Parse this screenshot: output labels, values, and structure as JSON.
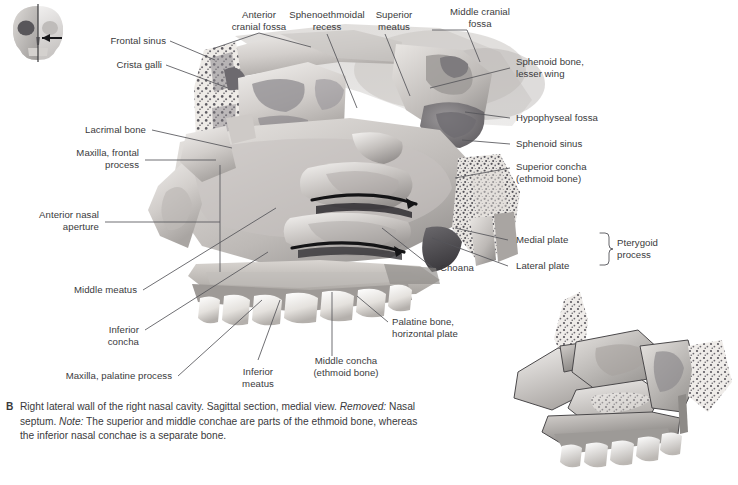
{
  "figure": {
    "plate_tag": "B",
    "caption_parts": {
      "p1": "Right lateral wall of the right nasal cavity. Sagittal section, medial view. ",
      "em1": "Removed:",
      "p2": " Nasal septum. ",
      "em2": "Note:",
      "p3": " The superior and middle conchae are parts of the ethmoid bone, whereas the inferior nasal conchae is a separate bone."
    },
    "orientation_icon": {
      "name": "skull-orientation-icon",
      "description": "Anterior skull with sagittal section line and view-direction arrow"
    },
    "colors": {
      "text": "#3a3a3c",
      "leader": "#55555a",
      "background": "#ffffff",
      "bone_light": "#e9e6e2",
      "bone_mid": "#b9b5b1",
      "bone_dark": "#6f6c6a",
      "cavity_shadow": "#58565a"
    }
  },
  "labels": [
    {
      "id": "frontal-sinus",
      "text": "Frontal sinus",
      "align": "right"
    },
    {
      "id": "crista-galli",
      "text": "Crista galli",
      "align": "right"
    },
    {
      "id": "anterior-cranial-fossa",
      "text": "Anterior\ncranial fossa",
      "align": "center"
    },
    {
      "id": "sphenoethmoidal-recess",
      "text": "Sphenoethmoidal\nrecess",
      "align": "center"
    },
    {
      "id": "superior-meatus",
      "text": "Superior\nmeatus",
      "align": "center"
    },
    {
      "id": "middle-cranial-fossa",
      "text": "Middle cranial\nfossa",
      "align": "center"
    },
    {
      "id": "sphenoid-bone-lesser-wing",
      "text": "Sphenoid bone,\nlesser wing",
      "align": "left"
    },
    {
      "id": "hypophyseal-fossa",
      "text": "Hypophyseal fossa",
      "align": "left"
    },
    {
      "id": "sphenoid-sinus",
      "text": "Sphenoid sinus",
      "align": "left"
    },
    {
      "id": "superior-concha",
      "text": "Superior concha\n(ethmoid bone)",
      "align": "left"
    },
    {
      "id": "medial-plate",
      "text": "Medial plate",
      "align": "left"
    },
    {
      "id": "lateral-plate",
      "text": "Lateral plate",
      "align": "left"
    },
    {
      "id": "pterygoid-process",
      "text": "Pterygoid\nprocess",
      "align": "left"
    },
    {
      "id": "choana",
      "text": "Choana",
      "align": "left"
    },
    {
      "id": "lacrimal-bone",
      "text": "Lacrimal bone",
      "align": "right"
    },
    {
      "id": "maxilla-frontal-process",
      "text": "Maxilla, frontal\nprocess",
      "align": "right"
    },
    {
      "id": "anterior-nasal-aperture",
      "text": "Anterior nasal\naperture",
      "align": "right"
    },
    {
      "id": "middle-meatus",
      "text": "Middle meatus",
      "align": "right"
    },
    {
      "id": "inferior-concha",
      "text": "Inferior\nconcha",
      "align": "right"
    },
    {
      "id": "maxilla-palatine-process",
      "text": "Maxilla, palatine process",
      "align": "right"
    },
    {
      "id": "inferior-meatus",
      "text": "Inferior\nmeatus",
      "align": "center"
    },
    {
      "id": "middle-concha",
      "text": "Middle concha\n(ethmoid bone)",
      "align": "center"
    },
    {
      "id": "palatine-bone-horizontal",
      "text": "Palatine bone,\nhorizontal plate",
      "align": "left"
    }
  ],
  "inset": {
    "name": "lateral-nasal-wall-bones-inset",
    "description": "Unlabeled lateral nasal wall showing individual bone boundaries"
  }
}
